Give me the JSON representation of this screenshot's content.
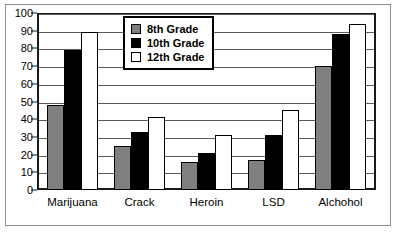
{
  "chart_data": {
    "type": "bar",
    "title": "",
    "xlabel": "",
    "ylabel": "",
    "ylim": [
      0,
      100
    ],
    "ytick_step": 10,
    "yticks": [
      0,
      10,
      20,
      30,
      40,
      50,
      60,
      70,
      80,
      90,
      100
    ],
    "grid": true,
    "legend_position": "top-center",
    "categories": [
      "Marijuana",
      "Crack",
      "Heroin",
      "LSD",
      "Alchohol"
    ],
    "series": [
      {
        "name": "8th Grade",
        "color": "#808080",
        "values": [
          48,
          25,
          16,
          17,
          70
        ]
      },
      {
        "name": "10th Grade",
        "color": "#000000",
        "values": [
          79,
          33,
          21,
          31,
          88
        ]
      },
      {
        "name": "12th Grade",
        "color": "#ffffff",
        "values": [
          89,
          41,
          31,
          45,
          94
        ]
      }
    ]
  }
}
